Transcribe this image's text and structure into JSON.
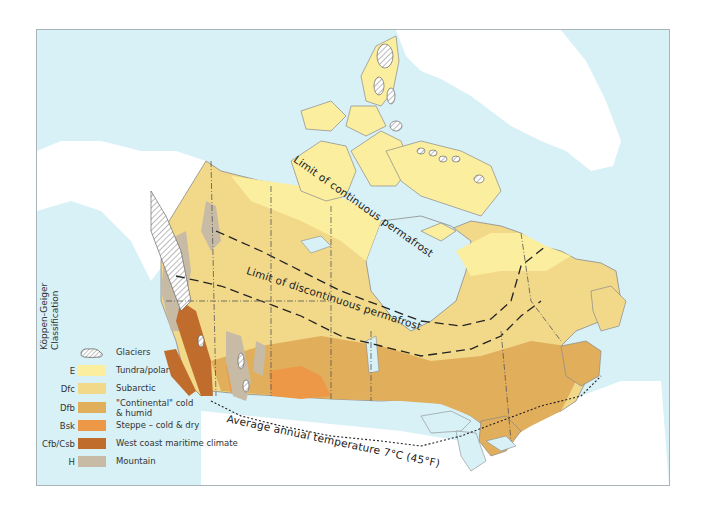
{
  "legend": {
    "title_line1": "Köppen-Geiger",
    "title_line2": "Classification",
    "items": [
      {
        "code": "",
        "label": "Glaciers",
        "label_line2": "",
        "color": "#ffffff",
        "pattern": "hatched",
        "icon": "glacier-icon"
      },
      {
        "code": "E",
        "label": "Tundra/polar",
        "label_line2": "",
        "color": "#fbee9e"
      },
      {
        "code": "Dfc",
        "label": "Subarctic",
        "label_line2": "",
        "color": "#f2d98a"
      },
      {
        "code": "Dfb",
        "label": "\"Continental\" cold",
        "label_line2": "& humid",
        "color": "#e1ae5c"
      },
      {
        "code": "Bsk",
        "label": "Steppe – cold & dry",
        "label_line2": "",
        "color": "#ec9847"
      },
      {
        "code": "Cfb/Csb",
        "label": "West coast maritime climate",
        "label_line2": "",
        "color": "#c06c2c"
      },
      {
        "code": "H",
        "label": "Mountain",
        "label_line2": "",
        "color": "#c8bba6"
      }
    ]
  },
  "map_labels": {
    "continuous_permafrost": "Limit of continuous permafrost",
    "discontinuous_permafrost": "Limit of discontinuous permafrost",
    "isotherm": "Average annual temperature 7°C (45°F)"
  },
  "colors": {
    "water": "#d8f1f7",
    "land_outside": "#ffffff",
    "border_lines": "#6b6b6b"
  }
}
